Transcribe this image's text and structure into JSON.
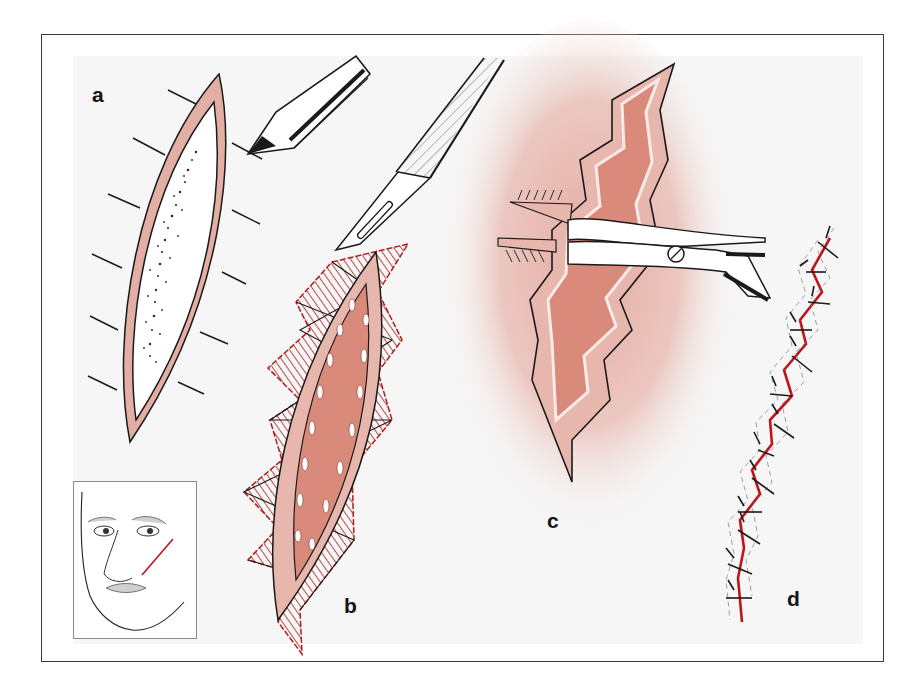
{
  "figure": {
    "panels": [
      {
        "id": "a",
        "label": "a",
        "content": "Scar outlined with marking pen, perpendicular guide lines"
      },
      {
        "id": "b",
        "label": "b",
        "content": "Scalpel excising zig-zag (W-pattern) triangles around elliptical scar excision"
      },
      {
        "id": "c",
        "label": "c",
        "content": "Undermining wound edges with scissors inside zig-zag wound"
      },
      {
        "id": "d",
        "label": "d",
        "content": "Closed zig-zag wound with interrupted sutures"
      }
    ],
    "inset": {
      "label": "",
      "content": "Face showing oblique cheek scar line"
    }
  },
  "labels": {
    "a": "a",
    "b": "b",
    "c": "c",
    "d": "d"
  },
  "colors": {
    "frame": "#3a3a3a",
    "background": "#f6f6f6",
    "skin_pink": "#e3aea4",
    "wound_salmon": "#d98a7b",
    "halo_pink": "#e8b4ab",
    "hatch_red": "#b01e1e",
    "suture_red": "#c0141a",
    "ink": "#141414"
  }
}
